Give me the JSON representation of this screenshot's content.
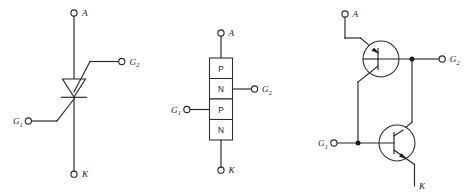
{
  "figure": {
    "background_color": "#ffffff",
    "line_color": "#262626",
    "text_color": "#1a1a1a"
  },
  "diagrams": [
    {
      "id": "symbol",
      "name": "thyristor-symbol-diagram",
      "kind": "schematic-symbol",
      "terminals": [
        {
          "key": "anode",
          "label": "A",
          "sub": "",
          "position": "top"
        },
        {
          "key": "gate2",
          "label": "G",
          "sub": "2",
          "position": "right"
        },
        {
          "key": "gate1",
          "label": "G",
          "sub": "1",
          "position": "left"
        },
        {
          "key": "cathode",
          "label": "K",
          "sub": "",
          "position": "bottom"
        }
      ]
    },
    {
      "id": "structure",
      "name": "four-layer-structure-diagram",
      "kind": "pnpn-layer-stack",
      "layers": [
        {
          "index": 0,
          "type": "P"
        },
        {
          "index": 1,
          "type": "N"
        },
        {
          "index": 2,
          "type": "P"
        },
        {
          "index": 3,
          "type": "N"
        }
      ],
      "terminals": [
        {
          "key": "anode",
          "label": "A",
          "sub": "",
          "position": "top"
        },
        {
          "key": "gate2",
          "label": "G",
          "sub": "2",
          "position": "right"
        },
        {
          "key": "gate1",
          "label": "G",
          "sub": "1",
          "position": "left"
        },
        {
          "key": "cathode",
          "label": "K",
          "sub": "",
          "position": "bottom"
        }
      ]
    },
    {
      "id": "equivalent",
      "name": "two-transistor-equivalent-diagram",
      "kind": "two-transistor-model",
      "transistors": [
        {
          "key": "pnp",
          "type": "PNP",
          "position": "upper-left"
        },
        {
          "key": "npn",
          "type": "NPN",
          "position": "lower-right"
        }
      ],
      "terminals": [
        {
          "key": "anode",
          "label": "A",
          "sub": "",
          "position": "top"
        },
        {
          "key": "gate2",
          "label": "G",
          "sub": "2",
          "position": "right"
        },
        {
          "key": "gate1",
          "label": "G",
          "sub": "1",
          "position": "left"
        },
        {
          "key": "cathode",
          "label": "K",
          "sub": "",
          "position": "bottom-right"
        }
      ]
    }
  ]
}
